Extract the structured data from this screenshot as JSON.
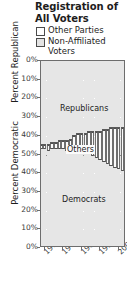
{
  "title": {
    "line1": "Registration of",
    "line2": "All Voters"
  },
  "legend": {
    "items": [
      {
        "label_line1": "Other Parties",
        "label_line2": "",
        "color": "#ffffff",
        "swatch": "sw-other"
      },
      {
        "label_line1": "Non-Affiliated",
        "label_line2": "Voters",
        "color": "#e3e3e3",
        "swatch": "sw-nonaff"
      }
    ]
  },
  "axes": {
    "y_top_title": "Percent Republican",
    "y_bottom_title": "Percent Democratic",
    "y_ticks_top": [
      "0%",
      "10%",
      "20%",
      "30%",
      "40%",
      "50%"
    ],
    "y_ticks_bottom": [
      "40%",
      "30%",
      "20%",
      "10%",
      "0%"
    ],
    "x_ticks": [
      "1960",
      "1970",
      "1980",
      "1990",
      "2000"
    ]
  },
  "band_labels": {
    "republicans": "Republicans",
    "others": "Others",
    "democrats": "Democrats"
  },
  "colors": {
    "plot_background": "#e6e6e6",
    "others_band": "#fbfbfb",
    "gridline": "#ffffff",
    "gridline_major": "#8e8e8e",
    "axis": "#6d6d6d",
    "text": "#1d1d1d"
  },
  "chart_data": {
    "type": "area",
    "title": "Registration of All Voters",
    "xlabel": "",
    "ylabel": "Percent Republican / Percent Democratic",
    "note": "100% stacked band chart. Republicans measured downward from 0% at top; Democrats measured upward from 0% at bottom; the 'Others' band (Other Parties + Non-Affiliated Voters) is the remainder in between.",
    "xlim": [
      1958,
      2004
    ],
    "ylim": [
      0,
      100
    ],
    "grid": true,
    "legend_position": "top",
    "x": [
      1958,
      1960,
      1962,
      1964,
      1966,
      1968,
      1970,
      1972,
      1974,
      1976,
      1978,
      1980,
      1982,
      1984,
      1986,
      1988,
      1990,
      1992,
      1994,
      1996,
      1998,
      2000,
      2002,
      2004
    ],
    "series": [
      {
        "name": "Republicans",
        "values": [
          45,
          45,
          45,
          44,
          44,
          43,
          43,
          43,
          42,
          40,
          39,
          39,
          39,
          38,
          38,
          38,
          38,
          37,
          37,
          36,
          36,
          36,
          36,
          36
        ]
      },
      {
        "name": "Others",
        "values": [
          2,
          2,
          3,
          3,
          3,
          4,
          4,
          5,
          6,
          9,
          10,
          10,
          11,
          12,
          13,
          14,
          15,
          17,
          18,
          20,
          21,
          22,
          23,
          24
        ]
      },
      {
        "name": "Democrats",
        "values": [
          53,
          53,
          52,
          53,
          53,
          53,
          53,
          52,
          52,
          51,
          51,
          51,
          50,
          50,
          49,
          48,
          47,
          46,
          45,
          44,
          43,
          42,
          41,
          40
        ]
      }
    ]
  }
}
